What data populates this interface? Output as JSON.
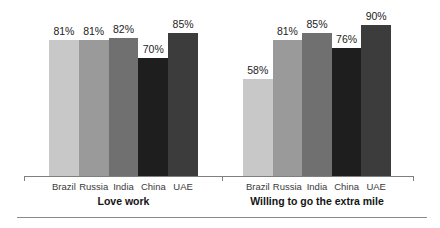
{
  "chart_data": {
    "type": "bar",
    "categories": [
      "Brazil",
      "Russia",
      "India",
      "China",
      "UAE"
    ],
    "groups": [
      {
        "label": "Love work",
        "values": [
          81,
          81,
          82,
          70,
          85
        ]
      },
      {
        "label": "Willing to go the extra mile",
        "values": [
          58,
          81,
          85,
          76,
          90
        ]
      }
    ],
    "value_suffix": "%",
    "bar_colors": [
      "#c8c8c8",
      "#9a9a9a",
      "#707070",
      "#1e1e1e",
      "#3c3c3c"
    ],
    "ylim": [
      0,
      100
    ],
    "grid": false,
    "legend": false,
    "value_label_position": "above-bar",
    "axis_color": "#7f7f7f",
    "divider_color": "#8a8a8a"
  }
}
